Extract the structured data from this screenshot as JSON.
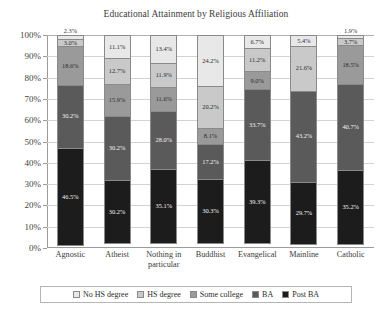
{
  "chart_data": {
    "type": "bar",
    "title": "Educational Attainment by Religious Affiliation",
    "xlabel": "",
    "ylabel": "",
    "ylim": [
      0,
      100
    ],
    "stacked": true,
    "normalized_percent": true,
    "grid": true,
    "legend_position": "bottom",
    "ytick_labels": [
      "100%",
      "90%",
      "80%",
      "70%",
      "60%",
      "50%",
      "40%",
      "30%",
      "20%",
      "10%",
      "0%"
    ],
    "ytick_values": [
      100,
      90,
      80,
      70,
      60,
      50,
      40,
      30,
      20,
      10,
      0
    ],
    "categories": [
      "Agnostic",
      "Atheist",
      "Nothing in particular",
      "Buddhist",
      "Evangelical",
      "Mainline",
      "Catholic"
    ],
    "series": [
      {
        "name": "No HS degree",
        "color": "#e8e8e8",
        "values": [
          2.3,
          11.1,
          13.4,
          24.2,
          6.7,
          5.4,
          1.9
        ],
        "labels": [
          "2.3%",
          "11.1%",
          "13.4%",
          "24.2%",
          "6.7%",
          "5.4%",
          "1.9%"
        ]
      },
      {
        "name": "HS degree",
        "color": "#c9c9c9",
        "values": [
          3.0,
          12.7,
          11.9,
          20.2,
          11.2,
          21.6,
          3.7
        ],
        "labels": [
          "3.0%",
          "12.7%",
          "11.9%",
          "20.2%",
          "11.2%",
          "21.6%",
          "3.7%"
        ]
      },
      {
        "name": "Some college",
        "color": "#9a9a9a",
        "values": [
          18.6,
          15.9,
          11.6,
          8.1,
          9.0,
          21.6,
          18.5
        ],
        "labels": [
          "18.6%",
          "15.9%",
          "11.6%",
          "8.1%",
          "9.0%",
          "21.6%",
          "18.5%"
        ]
      },
      {
        "name": "BA",
        "color": "#5a5a5a",
        "values": [
          30.2,
          30.2,
          28.0,
          17.2,
          33.7,
          43.2,
          40.7
        ],
        "labels": [
          "30.2%",
          "30.2%",
          "28.0%",
          "17.2%",
          "33.7%",
          "43.2%",
          "40.7%"
        ]
      },
      {
        "name": "Post BA",
        "color": "#1c1c1c",
        "values": [
          46.5,
          30.2,
          35.1,
          30.3,
          39.3,
          29.7,
          35.2
        ],
        "labels": [
          "46.5%",
          "30.2%",
          "35.1%",
          "30.3%",
          "39.3%",
          "29.7%",
          "35.2%"
        ]
      }
    ],
    "bars": [
      {
        "category": "Agnostic",
        "segments": [
          {
            "series": "No HS degree",
            "value": 2.3,
            "label": "2.3%"
          },
          {
            "series": "HS degree",
            "value": 3.0,
            "label": "3.0%"
          },
          {
            "series": "Some college",
            "value": 18.6,
            "label": "18.6%"
          },
          {
            "series": "BA",
            "value": 30.2,
            "label": "30.2%"
          },
          {
            "series": "Post BA",
            "value": 46.5,
            "label": "46.5%"
          }
        ]
      },
      {
        "category": "Atheist",
        "segments": [
          {
            "series": "No HS degree",
            "value": 11.1,
            "label": "11.1%"
          },
          {
            "series": "HS degree",
            "value": 12.7,
            "label": "12.7%"
          },
          {
            "series": "Some college",
            "value": 15.9,
            "label": "15.9%"
          },
          {
            "series": "BA",
            "value": 30.2,
            "label": "30.2%"
          },
          {
            "series": "Post BA",
            "value": 30.2,
            "label": "30.2%"
          }
        ]
      },
      {
        "category": "Nothing in particular",
        "segments": [
          {
            "series": "No HS degree",
            "value": 13.4,
            "label": "13.4%"
          },
          {
            "series": "HS degree",
            "value": 11.9,
            "label": "11.9%"
          },
          {
            "series": "Some college",
            "value": 11.6,
            "label": "11.6%"
          },
          {
            "series": "BA",
            "value": 28.0,
            "label": "28.0%"
          },
          {
            "series": "Post BA",
            "value": 35.1,
            "label": "35.1%"
          }
        ]
      },
      {
        "category": "Buddhist",
        "segments": [
          {
            "series": "No HS degree",
            "value": 24.2,
            "label": "24.2%"
          },
          {
            "series": "HS degree",
            "value": 20.2,
            "label": "20.2%"
          },
          {
            "series": "Some college",
            "value": 8.1,
            "label": "8.1%"
          },
          {
            "series": "BA",
            "value": 17.2,
            "label": "17.2%"
          },
          {
            "series": "Post BA",
            "value": 30.3,
            "label": "30.3%"
          }
        ]
      },
      {
        "category": "Evangelical",
        "segments": [
          {
            "series": "No HS degree",
            "value": 6.7,
            "label": "6.7%"
          },
          {
            "series": "HS degree",
            "value": 11.2,
            "label": "11.2%"
          },
          {
            "series": "Some college",
            "value": 9.0,
            "label": "9.0%"
          },
          {
            "series": "BA",
            "value": 33.7,
            "label": "33.7%"
          },
          {
            "series": "Post BA",
            "value": 39.3,
            "label": "39.3%"
          }
        ]
      },
      {
        "category": "Mainline",
        "segments": [
          {
            "series": "No HS degree",
            "value": 5.4,
            "label": "5.4%"
          },
          {
            "series": "HS degree",
            "value": 21.6,
            "label": "21.6%"
          },
          {
            "series": "Some college",
            "value": 0.0,
            "label": ""
          },
          {
            "series": "BA",
            "value": 43.2,
            "label": "43.2%"
          },
          {
            "series": "Post BA",
            "value": 29.7,
            "label": "29.7%"
          }
        ]
      },
      {
        "category": "Catholic",
        "segments": [
          {
            "series": "No HS degree",
            "value": 1.9,
            "label": "1.9%"
          },
          {
            "series": "HS degree",
            "value": 3.7,
            "label": "3.7%"
          },
          {
            "series": "Some college",
            "value": 18.5,
            "label": "18.5%"
          },
          {
            "series": "BA",
            "value": 40.7,
            "label": "40.7%"
          },
          {
            "series": "Post BA",
            "value": 35.2,
            "label": "35.2%"
          }
        ]
      }
    ],
    "legend": [
      {
        "label": "No HS degree",
        "color": "#e8e8e8"
      },
      {
        "label": "HS degree",
        "color": "#c9c9c9"
      },
      {
        "label": "Some college",
        "color": "#9a9a9a"
      },
      {
        "label": "BA",
        "color": "#5a5a5a"
      },
      {
        "label": "Post BA",
        "color": "#1c1c1c"
      }
    ]
  }
}
